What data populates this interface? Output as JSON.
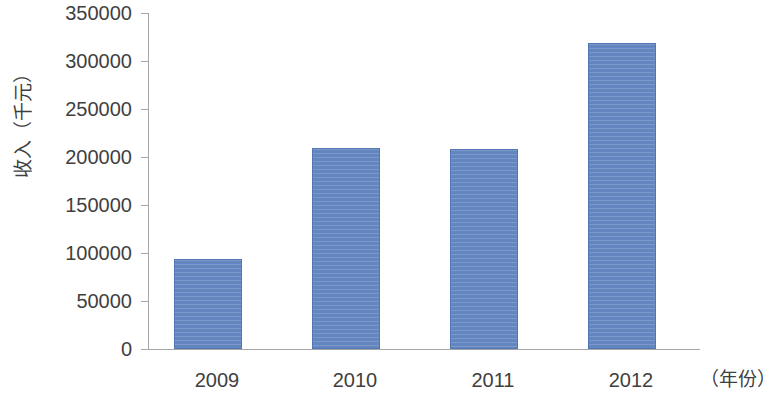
{
  "chart_data": {
    "type": "bar",
    "title": "",
    "subtitle": "",
    "categories": [
      "2009",
      "2010",
      "2011",
      "2012"
    ],
    "values": [
      93750,
      209400,
      208300,
      318750
    ],
    "series": [
      {
        "name": "收入",
        "values": [
          93750,
          209400,
          208300,
          318750
        ]
      }
    ],
    "xlabel": "（年份）",
    "ylabel": "收入（千元）",
    "ylim": [
      0,
      350000
    ],
    "ytick_interval": 50000,
    "ytick_labels": [
      "350000",
      "300000",
      "250000",
      "200000",
      "150000",
      "100000",
      "50000",
      "0"
    ],
    "ytick_values": [
      350000,
      300000,
      250000,
      200000,
      150000,
      100000,
      50000,
      0
    ],
    "xtick_labels": [
      "2009",
      "2010",
      "2011",
      "2012"
    ],
    "grid": false,
    "legend": false,
    "legend_position": "none",
    "bar_color": "#6385c0",
    "bar_border_color": "#5277b4",
    "axis_color": "#a6a6a6",
    "background_color": "#ffffff",
    "text_color": "#3f3f3f"
  }
}
